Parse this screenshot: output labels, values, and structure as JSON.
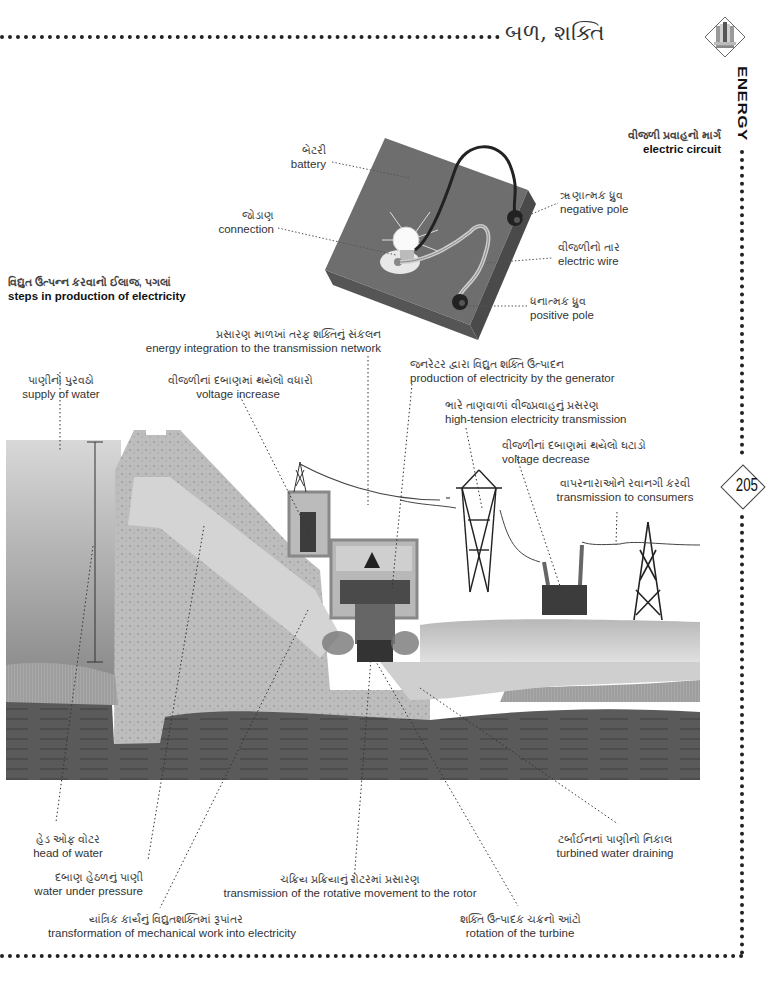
{
  "header": {
    "title": "બળ, શક્તિ",
    "section_vertical": "ENERGY",
    "page_number": "205",
    "icon": "dam-energy-icon"
  },
  "circuit": {
    "title_gu": "વીજળી પ્રવાહનો માર્ગ",
    "title_en": "electric circuit",
    "labels": [
      {
        "gu": "બેટરી",
        "en": "battery"
      },
      {
        "gu": "જોડાણ",
        "en": "connection"
      },
      {
        "gu": "ૠણાત્મક ધ્રુવ",
        "en": "negative pole"
      },
      {
        "gu": "વીજળીનો તાર",
        "en": "electric wire"
      },
      {
        "gu": "ધનાત્મક ધ્રુવ",
        "en": "positive pole"
      }
    ]
  },
  "steps": {
    "title_gu": "વિદ્યુત ઉત્પન્ન કરવાનો ઈલાજ, પગલાં",
    "title_en": "steps in production of electricity",
    "top_labels": [
      {
        "gu": "પ્રસારણ માળખાં તરફ શક્તિનું સંકલન",
        "en": "energy integration to the transmission network"
      },
      {
        "gu": "પાણીનો પુરવઠો",
        "en": "supply of water"
      },
      {
        "gu": "વીજળીનાં દબાણમાં થયેલો વધારો",
        "en": "voltage increase"
      },
      {
        "gu": "જનરેટર દ્વારા વિદ્યુત શક્તિ ઉત્પાદન",
        "en": "production of electricity by the generator"
      },
      {
        "gu": "ભારે તાણવાળાં વીજપ્રવાહનું પ્રસરણ",
        "en": "high-tension electricity transmission"
      },
      {
        "gu": "વીજળીનાં દબાણમાં થયેલો ઘટાડો",
        "en": "voltage decrease"
      },
      {
        "gu": "વાપરનારાઓને રવાનગી કરવી",
        "en": "transmission to consumers"
      }
    ],
    "bottom_labels": [
      {
        "gu": "હેડ ઓફ વોટર",
        "en": "head of water"
      },
      {
        "gu": "ટર્બાઈનનાં પાણીનો નિકાલ",
        "en": "turbined water draining"
      },
      {
        "gu": "દબાણ હેઠળનું પાણી",
        "en": "water under pressure"
      },
      {
        "gu": "ચક્રિય પ્રક્રિયાનું રોટરમાં પ્રસારણ",
        "en": "transmission of the rotative movement to the rotor"
      },
      {
        "gu": "યાંત્રિક કાર્યનું વિદ્યુતશક્તિમાં રૂપાંતર",
        "en": "transformation of mechanical work into electricity"
      },
      {
        "gu": "શક્તિ ઉત્પાદક ચક્રનો આંટો",
        "en": "rotation of the turbine"
      }
    ]
  }
}
